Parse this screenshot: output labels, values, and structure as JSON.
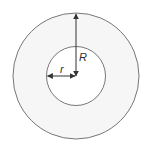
{
  "diagram": {
    "type": "annulus",
    "outer_circle": {
      "cx": 76,
      "cy": 76,
      "r": 63
    },
    "inner_circle": {
      "cx": 76,
      "cy": 76,
      "r": 29.5
    },
    "labels": {
      "outer_radius": "R",
      "inner_radius": "r"
    },
    "colors": {
      "ring_fill": "#f6f6f6",
      "inner_fill": "#ffffff",
      "stroke": "#777777",
      "arrow": "#333333",
      "text": "#333333"
    }
  }
}
